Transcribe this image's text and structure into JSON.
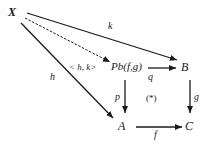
{
  "diagram": {
    "type": "commutative-diagram",
    "colors": {
      "ink": "#1a1a1a",
      "background": "#ffffff"
    },
    "nodes": {
      "X": {
        "label": "X",
        "x": 14,
        "y": 13
      },
      "Pb": {
        "label": "Pb(f,g)",
        "x": 128,
        "y": 67
      },
      "B": {
        "label": "B",
        "x": 182,
        "y": 67
      },
      "A": {
        "label": "A",
        "x": 122,
        "y": 126
      },
      "C": {
        "label": "C",
        "x": 189,
        "y": 126
      }
    },
    "edges": [
      {
        "id": "k",
        "from": "X",
        "to": "B",
        "label": "k",
        "style": "solid"
      },
      {
        "id": "hk",
        "from": "X",
        "to": "Pb",
        "label": "< h, k>",
        "style": "dashed"
      },
      {
        "id": "h",
        "from": "X",
        "to": "A",
        "label": "h",
        "style": "solid"
      },
      {
        "id": "q",
        "from": "Pb",
        "to": "B",
        "label": "q",
        "style": "solid"
      },
      {
        "id": "p",
        "from": "Pb",
        "to": "A",
        "label": "p",
        "style": "solid"
      },
      {
        "id": "g",
        "from": "B",
        "to": "C",
        "label": "g",
        "style": "solid"
      },
      {
        "id": "f",
        "from": "A",
        "to": "C",
        "label": "f",
        "style": "solid"
      }
    ],
    "annotation": "(*)"
  }
}
